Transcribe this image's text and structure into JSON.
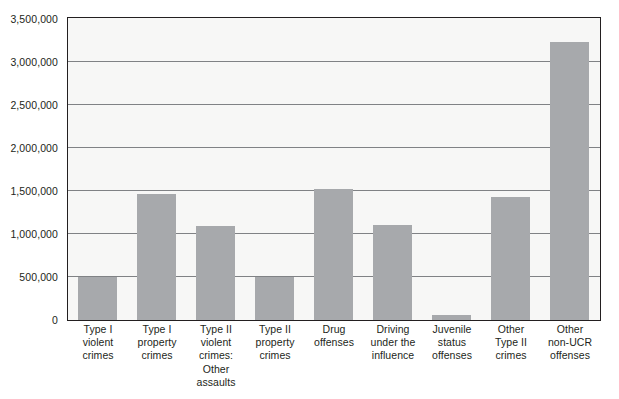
{
  "chart_data": {
    "type": "bar",
    "title": "",
    "xlabel": "",
    "ylabel": "",
    "ylim": [
      0,
      3500000
    ],
    "ytick_step": 500000,
    "grid": true,
    "legend": false,
    "legend_position": "none",
    "bar_color": "#a7a9ac",
    "axis_color": "#231f20",
    "gridline_color": "#808285",
    "plot_background": "#f7f7f6",
    "page_background": "#ffffff",
    "ytick_labels": [
      "3,500,000",
      "3,000,000",
      "2,500,000",
      "2,000,000",
      "1,500,000",
      "1,000,000",
      "500,000",
      "0"
    ],
    "ytick_values": [
      3500000,
      3000000,
      2500000,
      2000000,
      1500000,
      1000000,
      500000,
      0
    ],
    "categories": [
      "Type I violent crimes",
      "Type I property crimes",
      "Type II violent crimes: Other assaults",
      "Type II property crimes",
      "Drug offenses",
      "Driving under the influence",
      "Juvenile status offenses",
      "Other Type II crimes",
      "Other non-UCR offenses"
    ],
    "category_lines": [
      [
        "Type I",
        "violent",
        "crimes"
      ],
      [
        "Type I",
        "property",
        "crimes"
      ],
      [
        "Type II",
        "violent",
        "crimes:",
        "Other",
        "assaults"
      ],
      [
        "Type II",
        "property",
        "crimes"
      ],
      [
        "Drug",
        "offenses"
      ],
      [
        "Driving",
        "under the",
        "influence"
      ],
      [
        "Juvenile",
        "status",
        "offenses"
      ],
      [
        "Other",
        "Type II",
        "crimes"
      ],
      [
        "Other",
        "non-UCR",
        "offenses"
      ]
    ],
    "values": [
      500000,
      1470000,
      1090000,
      505000,
      1520000,
      1100000,
      60000,
      1430000,
      3230000
    ]
  }
}
